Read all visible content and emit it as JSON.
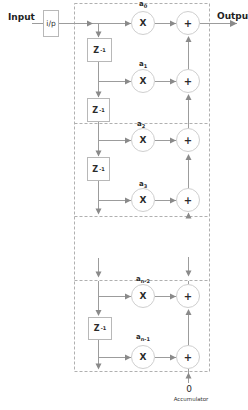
{
  "diagram": {
    "type": "fir-filter-mac-block-diagram",
    "labels": {
      "input": "Input",
      "output": "Output",
      "input_block": "i/p",
      "accumulator_init": "0",
      "accumulator": "Accumulator"
    },
    "delay_block": {
      "base": "Z",
      "sup": "-1"
    },
    "ops": {
      "multiply": "X",
      "add": "+"
    },
    "coefficients": [
      {
        "base": "a",
        "sub": "0"
      },
      {
        "base": "a",
        "sub": "1"
      },
      {
        "base": "a",
        "sub": "2"
      },
      {
        "base": "a",
        "sub": "3"
      },
      {
        "base": "a",
        "sub": "n-2"
      },
      {
        "base": "a",
        "sub": "n-1"
      }
    ],
    "colors": {
      "wire": "#9c9c9c",
      "arrow": "#8a8a8a",
      "dashed_box": "#b0b0b0",
      "circle_border": "#cfcfcf",
      "block_border": "#b8b8b8",
      "text": "#2b2b2b"
    }
  }
}
